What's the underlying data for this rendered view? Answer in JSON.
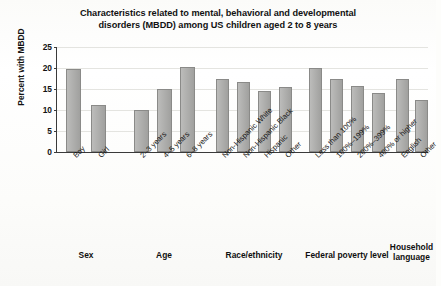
{
  "chart_data": {
    "type": "bar",
    "title": "Characteristics related to mental, behavioral and developmental disorders (MBDD) among US children aged 2 to 8 years",
    "title_line1": "Characteristics related to mental, behavioral and developmental",
    "title_line2": "disorders (MBDD) among US children aged 2 to 8 years",
    "xlabel": "",
    "ylabel": "Percent with MBDD",
    "ylim": [
      0,
      25
    ],
    "yticks": [
      0,
      5,
      10,
      15,
      20,
      25
    ],
    "ytick_labels": [
      "0",
      "5",
      "10",
      "15",
      "20",
      "25"
    ],
    "grid": true,
    "legend": "none",
    "bar_color": "#a9a9a7",
    "bar_edge_color": "#8a8a88",
    "axis_color": "#3a3a3a",
    "categories": [
      "Boy",
      "Girl",
      "2–3 years",
      "4–5 years",
      "6–8 years",
      "Non-Hispanic White",
      "Non-Hispanic Black",
      "Hispanic",
      "Other",
      "Less than 100%",
      "100%–199%",
      "200%–399%",
      "400% or higher",
      "English",
      "Other"
    ],
    "values": [
      19.8,
      11.2,
      10.0,
      15.0,
      20.2,
      17.5,
      16.6,
      14.6,
      15.4,
      20.0,
      17.5,
      15.6,
      14.0,
      17.5,
      12.4
    ],
    "groups": [
      {
        "name": "Sex",
        "title_display": "Sex",
        "categories": [
          "Boy",
          "Girl"
        ],
        "values": [
          19.8,
          11.2
        ]
      },
      {
        "name": "Age",
        "title_display": "Age",
        "categories": [
          "2–3 years",
          "4–5 years",
          "6–8 years"
        ],
        "values": [
          10.0,
          15.0,
          20.2
        ]
      },
      {
        "name": "Race/ethnicity",
        "title_display": "Race/ethnicity",
        "categories": [
          "Non-Hispanic White",
          "Non-Hispanic Black",
          "Hispanic",
          "Other"
        ],
        "values": [
          17.5,
          16.6,
          14.6,
          15.4
        ]
      },
      {
        "name": "Federal poverty level",
        "title_display": "Federal poverty level",
        "categories": [
          "Less than 100%",
          "100%–199%",
          "200%–399%",
          "400% or higher"
        ],
        "values": [
          20.0,
          17.5,
          15.6,
          14.0
        ]
      },
      {
        "name": "Household language",
        "title_display": "Household\nlanguage",
        "categories": [
          "English",
          "Other"
        ],
        "values": [
          17.5,
          12.4
        ]
      }
    ]
  }
}
